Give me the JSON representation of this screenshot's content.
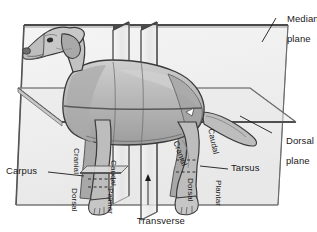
{
  "figure": {
    "style": "grayscale line illustration",
    "colors": {
      "plane_fill": "#efefef",
      "plane_edge": "#6b6b6b",
      "plane_edge_dark": "#4a4a4a",
      "body_fill": "#b9b9b9",
      "body_shadow": "#8f8f8f",
      "body_highlight": "#d2d2d2",
      "outline": "#3a3a3a",
      "text": "#1a1a1a",
      "background": "#ffffff"
    }
  },
  "planes": [
    {
      "id": "median",
      "label_line1": "Median",
      "label_line2": "plane"
    },
    {
      "id": "dorsal",
      "label_line1": "Dorsal",
      "label_line2": "plane"
    },
    {
      "id": "transverse",
      "label_line1": "Transverse",
      "label_line2": "planes"
    }
  ],
  "callouts": {
    "median_plane": {
      "line1": "Median",
      "line2": "plane"
    },
    "dorsal_plane": {
      "line1": "Dorsal",
      "line2": "plane"
    },
    "transverse_planes": {
      "line1": "Transverse",
      "line2": "planes"
    },
    "carpus": {
      "text": "Carpus"
    },
    "tarsus": {
      "text": "Tarsus"
    }
  },
  "direction_terms": {
    "forelimb": {
      "cranial": "Cranial",
      "caudal": "Caudal",
      "dorsal": "Dorsal",
      "palmar": "Palmar"
    },
    "hindlimb": {
      "cranial": "Cranial",
      "caudal": "Caudal",
      "dorsal": "Dorsal",
      "plantar": "Plantar"
    }
  },
  "joints": [
    {
      "name": "Carpus",
      "limb": "forelimb"
    },
    {
      "name": "Tarsus",
      "limb": "hindlimb"
    }
  ]
}
